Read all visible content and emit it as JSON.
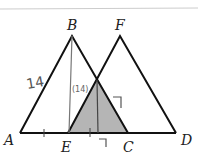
{
  "diagram": {
    "type": "geometry",
    "colors": {
      "stroke": "#111111",
      "shade": "#b5b5b5",
      "annotation": "#555555",
      "topline": "#cccccc"
    },
    "points": {
      "A": {
        "label": "A",
        "x": 20,
        "y": 133
      },
      "B": {
        "label": "B",
        "x": 72,
        "y": 36
      },
      "F": {
        "label": "F",
        "x": 120,
        "y": 36
      },
      "E": {
        "label": "E",
        "x": 68,
        "y": 133
      },
      "C": {
        "label": "C",
        "x": 128,
        "y": 133
      },
      "D": {
        "label": "D",
        "x": 176,
        "y": 133
      }
    },
    "annotations": {
      "side_AB": "14",
      "altitude_label": "(14)",
      "right_angle_marks": [
        "7",
        "7"
      ]
    }
  }
}
